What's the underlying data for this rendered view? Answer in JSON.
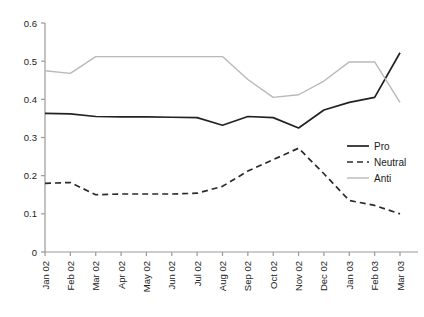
{
  "chart_data": {
    "type": "line",
    "title": "",
    "subtitle": "",
    "xlabel": "",
    "ylabel": "",
    "grid": false,
    "legend_position": "right",
    "ylim": [
      0,
      0.6
    ],
    "yticks": [
      0,
      0.1,
      0.2,
      0.3,
      0.4,
      0.5,
      0.6
    ],
    "ytick_labels": [
      "0",
      "0.1",
      "0.2",
      "0.3",
      "0.4",
      "0.5",
      "0.6"
    ],
    "categories": [
      "Jan 02",
      "Feb 02",
      "Mar 02",
      "Apr 02",
      "May 02",
      "Jun 02",
      "Jul 02",
      "Aug 02",
      "Sep 02",
      "Oct 02",
      "Nov 02",
      "Dec 02",
      "Jan 03",
      "Feb 03",
      "Mar 03"
    ],
    "series": [
      {
        "name": "Pro",
        "style": "solid",
        "color": "#222222",
        "values": [
          0.363,
          0.362,
          0.355,
          0.354,
          0.354,
          0.353,
          0.352,
          0.332,
          0.355,
          0.352,
          0.325,
          0.372,
          0.392,
          0.405,
          0.522
        ]
      },
      {
        "name": "Neutral",
        "style": "dashed",
        "color": "#2b2b2b",
        "values": [
          0.18,
          0.182,
          0.15,
          0.152,
          0.152,
          0.152,
          0.154,
          0.172,
          0.212,
          0.242,
          0.272,
          0.205,
          0.135,
          0.122,
          0.1
        ]
      },
      {
        "name": "Anti",
        "style": "solid",
        "color": "#b9b9b9",
        "values": [
          0.475,
          0.468,
          0.512,
          0.512,
          0.512,
          0.512,
          0.512,
          0.512,
          0.452,
          0.405,
          0.412,
          0.448,
          0.498,
          0.498,
          0.392
        ]
      }
    ]
  },
  "legend": {
    "items": [
      {
        "label": "Pro"
      },
      {
        "label": "Neutral"
      },
      {
        "label": "Anti"
      }
    ]
  },
  "axes": {
    "y_axis_name": "y-axis",
    "x_axis_name": "x-axis"
  }
}
